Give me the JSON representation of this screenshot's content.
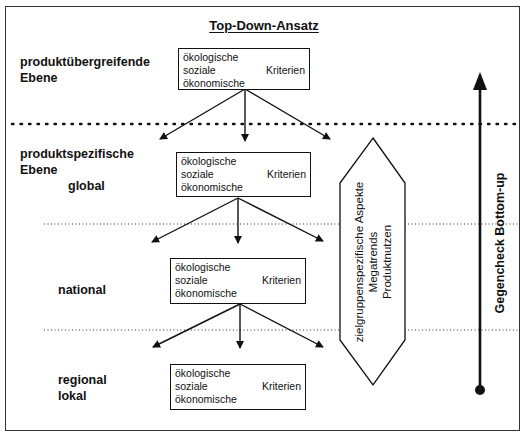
{
  "diagram": {
    "title": "Top-Down-Ansatz",
    "levels": [
      {
        "label_line1": "produktübergreifende",
        "label_line2": "Ebene"
      },
      {
        "label_line1": "produktspezifische",
        "label_line2": "Ebene",
        "sub_label": "global"
      },
      {
        "label_line1": "national"
      },
      {
        "label_line1": "regional",
        "label_line2": "lokal"
      }
    ],
    "criteria_box": {
      "line1": "ökologische",
      "line2": "soziale",
      "line2_right": "Kriterien",
      "line3": "ökonomische"
    },
    "side_shape": {
      "line1": "zielgruppenspezifische Aspekte",
      "line2": "Megatrends",
      "line3": "Produktnutzen"
    },
    "vertical_arrow_label": "Gegencheck Bottom-up"
  }
}
